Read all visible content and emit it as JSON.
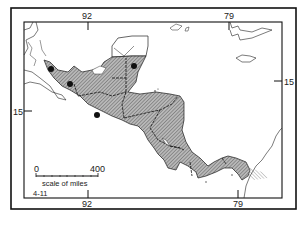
{
  "map": {
    "longitude_labels_top": [
      "92",
      "79"
    ],
    "longitude_labels_bottom": [
      "92",
      "79"
    ],
    "latitude_labels": {
      "left": "15",
      "right": "15"
    },
    "scale": {
      "start": "0",
      "end": "400",
      "caption": "scale of miles"
    },
    "figure_tag": "4-11",
    "colors": {
      "land_shaded": "#a8a8a8",
      "outline": "#1a1a1a",
      "background": "#ffffff"
    },
    "markers": [
      {
        "name": "site-1"
      },
      {
        "name": "site-2"
      },
      {
        "name": "site-3"
      },
      {
        "name": "site-4"
      }
    ]
  }
}
